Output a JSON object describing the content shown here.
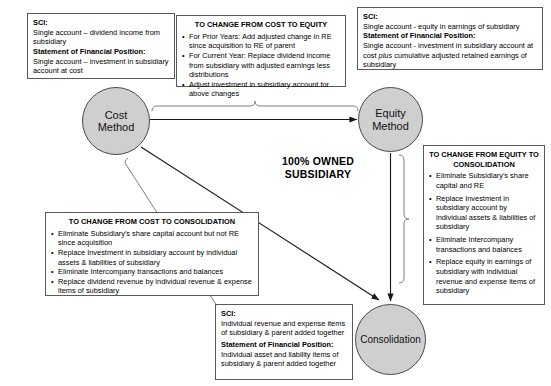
{
  "title": "",
  "center_label": "100% OWNED\nSUBSIDIARY",
  "nodes": [
    {
      "id": "cost",
      "label": "Cost\nMethod"
    },
    {
      "id": "equity",
      "label": "Equity\nMethod"
    },
    {
      "id": "consolidation",
      "label": "Consolidation"
    }
  ],
  "boxes": {
    "sci_cost": {
      "sci_heading": "SCI:",
      "sci_text": "Single account – dividend income from subsidiary",
      "sfp_heading": "Statement of Financial Position:",
      "sfp_text": "Single account – investment in subsidiary account at cost"
    },
    "cost_to_equity": {
      "heading": "TO CHANGE FROM COST TO EQUITY",
      "bullets": [
        "For Prior Years: Add adjusted change in RE since acquisition to RE of parent",
        "For Current Year: Replace dividend income from subsidiary with adjusted earnings less distributions",
        "Adjust investment in subsidiary account for above changes"
      ]
    },
    "sci_equity": {
      "sci_heading": "SCI:",
      "sci_text": "Single account - equity in earnings of subsidiary",
      "sfp_heading": "Statement of Financial Position:",
      "sfp_text_a": "Single account - investment in subsidiary account at cost ",
      "sfp_text_italic": "plus",
      "sfp_text_b": " cumulative adjusted retained earnings of subsidiary"
    },
    "equity_to_consolidation": {
      "heading": "TO CHANGE FROM EQUITY TO CONSOLIDATION",
      "bullets": [
        "Eliminate Subsidiary's share capital and RE",
        "Replace Investment in subsidiary account by individual assets & liabilities of subsidiary",
        "Eliminate Intercompany transactions and balances",
        "Replace equity in earnings of subsidiary with individual revenue and expense items of subsidiary"
      ]
    },
    "cost_to_consolidation": {
      "heading": "TO CHANGE FROM COST TO CONSOLIDATION",
      "bullets": [
        "Eliminate Subsidiary's share capital account but not RE since acquisition",
        "Replace Investment in subsidiary account by individual assets & liabilities of subsidiary",
        "Eliminate Intercompany transactions and balances",
        "Replace dividend revenue by individual revenue & expense items of subsidiary"
      ]
    },
    "sci_consolidation": {
      "sci_heading": "SCI:",
      "sci_text": "Individual revenue and expense items of subsidiary & parent added together",
      "sfp_heading": "Statement of Financial Position:",
      "sfp_text": "Individual asset and liability items of subsidiary & parent added together"
    }
  },
  "colors": {
    "node_fill": "#cfcfcf",
    "node_stroke": "#4a4a4a",
    "box_stroke": "#59595b",
    "line": "#1a1a1a",
    "brace": "#8c8c8c",
    "text": "#000000",
    "background": "#ffffff"
  },
  "connectors": [
    {
      "name": "cost-to-equity-arrow",
      "from": "cost",
      "to": "equity",
      "direction": "horizontal"
    },
    {
      "name": "cost-to-consolidation-arrow",
      "from": "cost",
      "to": "consolidation",
      "direction": "diagonal"
    },
    {
      "name": "equity-to-consolidation-arrow",
      "from": "equity",
      "to": "consolidation",
      "direction": "vertical"
    }
  ]
}
